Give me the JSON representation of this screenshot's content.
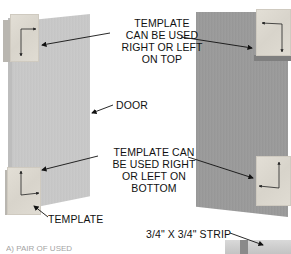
{
  "figure": {
    "labels": {
      "template_top": [
        "TEMPLATE",
        "CAN BE USED",
        "RIGHT OR LEFT",
        "ON TOP"
      ],
      "door": "DOOR",
      "template_bottom": [
        "TEMPLATE CAN",
        "BE USED RIGHT",
        "OR LEFT ON",
        "BOTTOM"
      ],
      "template": "TEMPLATE",
      "strip": "3/4\" X 3/4\" STRIP",
      "cut_off_fragment": "A) PAIR OF USED"
    },
    "parts": {
      "left_door": "door-panel",
      "right_door": "door-panel",
      "templates": [
        "top-left",
        "bottom-left",
        "top-right",
        "bottom-right"
      ],
      "strip": "3/4 x 3/4 strip"
    },
    "colors": {
      "left_door": "#c8c8c8",
      "right_door": "#9a9a9a",
      "template": "#ddd9d0",
      "text": "#111111"
    }
  }
}
